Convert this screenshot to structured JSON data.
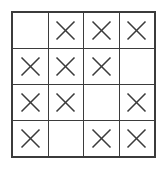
{
  "figure": {
    "name": "four-by-four-mark-grid",
    "rows": 4,
    "columns": 4,
    "mark_symbol": "X",
    "empty_symbol": "",
    "line_color": "#3b3b3b",
    "cell_color": "#ffffff",
    "background_color": "#ffffff",
    "total_marks": 12,
    "total_empty": 4
  },
  "grid": {
    "cells": [
      [
        {
          "id": "r1c1",
          "marked": false,
          "label": ""
        },
        {
          "id": "r1c2",
          "marked": true,
          "label": "X"
        },
        {
          "id": "r1c3",
          "marked": true,
          "label": "X"
        },
        {
          "id": "r1c4",
          "marked": true,
          "label": "X"
        }
      ],
      [
        {
          "id": "r2c1",
          "marked": true,
          "label": "X"
        },
        {
          "id": "r2c2",
          "marked": true,
          "label": "X"
        },
        {
          "id": "r2c3",
          "marked": true,
          "label": "X"
        },
        {
          "id": "r2c4",
          "marked": false,
          "label": ""
        }
      ],
      [
        {
          "id": "r3c1",
          "marked": true,
          "label": "X"
        },
        {
          "id": "r3c2",
          "marked": true,
          "label": "X"
        },
        {
          "id": "r3c3",
          "marked": false,
          "label": ""
        },
        {
          "id": "r3c4",
          "marked": true,
          "label": "X"
        }
      ],
      [
        {
          "id": "r4c1",
          "marked": true,
          "label": "X"
        },
        {
          "id": "r4c2",
          "marked": false,
          "label": ""
        },
        {
          "id": "r4c3",
          "marked": true,
          "label": "X"
        },
        {
          "id": "r4c4",
          "marked": true,
          "label": "X"
        }
      ]
    ]
  }
}
